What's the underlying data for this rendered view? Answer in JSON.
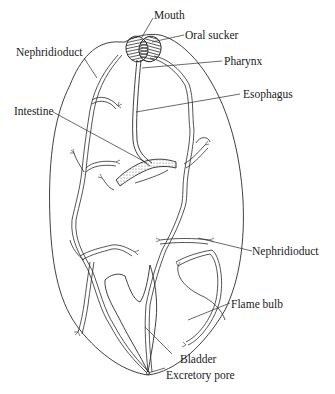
{
  "diagram": {
    "labels": {
      "mouth": "Mouth",
      "oral_sucker": "Oral sucker",
      "nephridioduct_top": "Nephridioduct",
      "pharynx": "Pharynx",
      "esophagus": "Esophagus",
      "intestine": "Intestine",
      "nephridioduct_right": "Nephridioduct",
      "flame_bulb": "Flame bulb",
      "bladder": "Bladder",
      "excretory_pore": "Excretory pore"
    },
    "colors": {
      "line": "#2a2a2a",
      "background": "#ffffff"
    }
  }
}
